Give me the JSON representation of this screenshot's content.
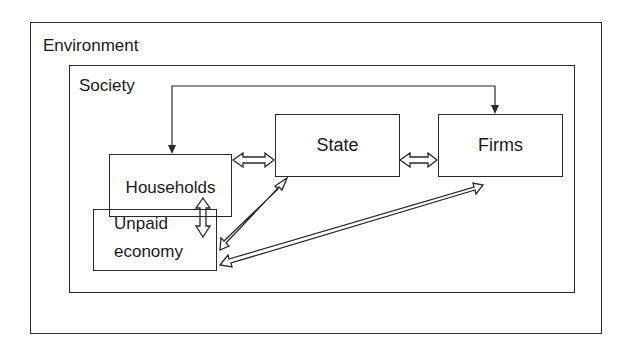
{
  "diagram": {
    "outer": {
      "label": "Environment"
    },
    "inner": {
      "label": "Society"
    },
    "nodes": [
      {
        "id": "households",
        "label": "Households"
      },
      {
        "id": "unpaid",
        "label_line1": "Unpaid",
        "label_line2": "economy"
      },
      {
        "id": "state",
        "label": "State"
      },
      {
        "id": "firms",
        "label": "Firms"
      }
    ],
    "edges": [
      {
        "from": "households",
        "to": "state",
        "type": "double-hollow-arrow"
      },
      {
        "from": "state",
        "to": "firms",
        "type": "double-hollow-arrow"
      },
      {
        "from": "households",
        "to": "unpaid",
        "type": "double-hollow-arrow-vertical"
      },
      {
        "from": "state",
        "to": "unpaid",
        "type": "double-hollow-arrow-diagonal"
      },
      {
        "from": "firms",
        "to": "unpaid",
        "type": "double-hollow-arrow-diagonal"
      },
      {
        "from": "households",
        "to": "firms",
        "type": "single-line-arrow-both-ends"
      }
    ],
    "colors": {
      "line": "#2a2a2a",
      "background": "#ffffff"
    }
  }
}
